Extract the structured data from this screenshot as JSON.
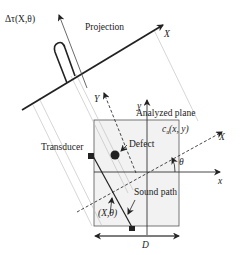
{
  "diagram": {
    "labels": {
      "projection_value": "Δτ(X,θ)",
      "projection": "Projection",
      "projection_axis": "X",
      "rotated_y_axis": "Y",
      "analyzed_plane": "Analyzed plane",
      "velocity_field": "c",
      "velocity_field_sub": "a",
      "velocity_field_args": "(x, y)",
      "defect": "Defect",
      "transducer": "Transducer",
      "rotated_x_axis": "X",
      "angle": "θ",
      "x_axis": "x",
      "y_axis": "y",
      "sound_path": "Sound path",
      "path_coord": "(X,θ)",
      "width_dim": "D"
    },
    "colors": {
      "line": "#222222",
      "plane_fill": "#f2f2f2",
      "guide_line": "#b8b8b8"
    }
  }
}
